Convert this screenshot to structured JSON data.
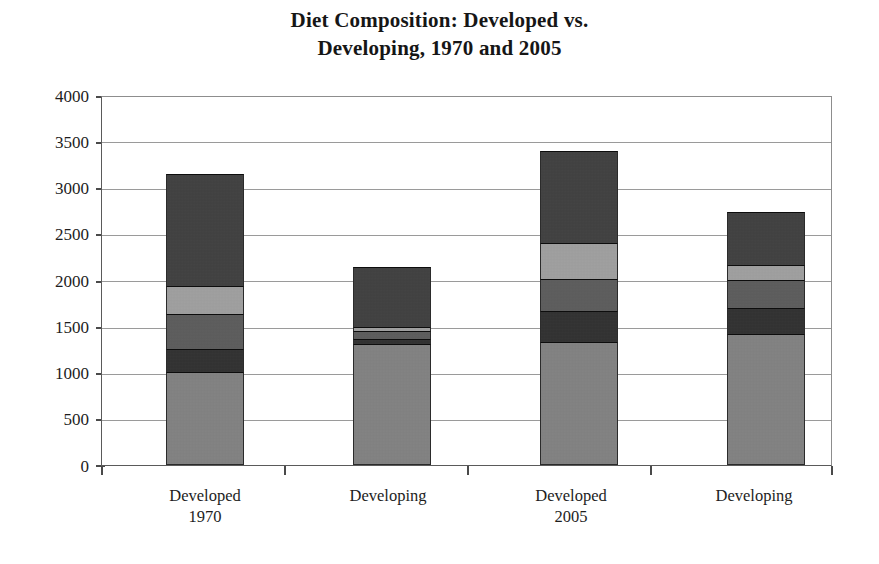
{
  "chart_data": {
    "type": "bar",
    "subtype": "stacked-bar",
    "title": "Diet Composition: Developed vs. Developing, 1970 and 2005",
    "title_lines": [
      "Diet Composition: Developed vs.",
      "Developing, 1970 and 2005"
    ],
    "xlabel": "",
    "ylabel": "",
    "ylim": [
      0,
      4000
    ],
    "ytick_step": 500,
    "ytick_labels": [
      "4000",
      "3500",
      "3000",
      "2500",
      "2000",
      "1500",
      "1000",
      "500",
      "0"
    ],
    "ytick_values": [
      4000,
      3500,
      3000,
      2500,
      2000,
      1500,
      1000,
      500,
      0
    ],
    "grid": true,
    "grid_axis": "y",
    "legend": null,
    "legend_position": "none",
    "categories": [
      "Developed",
      "Developing",
      "Developed",
      "Developing"
    ],
    "category_sublabels": [
      "1970",
      "",
      "2005",
      ""
    ],
    "category_groups": [
      "1970",
      "1970",
      "2005",
      "2005"
    ],
    "stack_order_bottom_to_top": [
      "Cereals & starchy roots",
      "Sugars & sweeteners",
      "Meat, dairy & animal products",
      "Vegetable oils & fats",
      "Other foods"
    ],
    "series": [
      {
        "name": "Cereals & starchy roots",
        "color": "#838383",
        "values": [
          1010,
          1310,
          1330,
          1420
        ]
      },
      {
        "name": "Sugars & sweeteners",
        "color": "#2f2f2f",
        "values": [
          245,
          55,
          330,
          275
        ]
      },
      {
        "name": "Meat, dairy & animal products",
        "color": "#5c5c5c",
        "values": [
          375,
          80,
          355,
          305
        ]
      },
      {
        "name": "Vegetable oils & fats",
        "color": "#a2a2a2",
        "values": [
          300,
          50,
          390,
          160
        ]
      },
      {
        "name": "Other foods",
        "color": "#3f3f3f",
        "values": [
          1215,
          645,
          995,
          575
        ]
      }
    ],
    "totals": [
      3145,
      2140,
      3400,
      2735
    ],
    "units": "kcal per person per day"
  },
  "axis": {
    "y_tick_0": "0",
    "y_tick_500": "500",
    "y_tick_1000": "1000",
    "y_tick_1500": "1500",
    "y_tick_2000": "2000",
    "y_tick_2500": "2500",
    "y_tick_3000": "3000",
    "y_tick_3500": "3500",
    "y_tick_4000": "4000"
  },
  "xaxis": {
    "labels": [
      {
        "main": "Developed",
        "sub": "1970"
      },
      {
        "main": "Developing",
        "sub": ""
      },
      {
        "main": "Developed",
        "sub": "2005"
      },
      {
        "main": "Developing",
        "sub": ""
      }
    ]
  }
}
